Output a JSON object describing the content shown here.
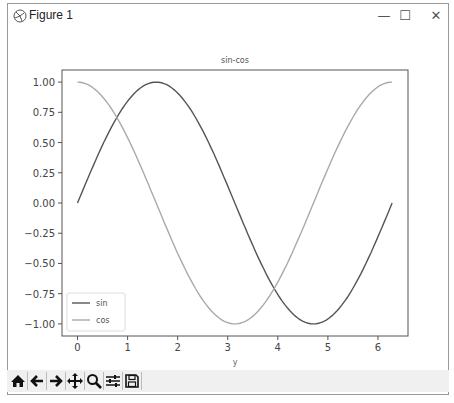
{
  "window": {
    "title": "Figure 1",
    "controls": {
      "minimize": "—",
      "maximize": "☐",
      "close": "✕"
    }
  },
  "toolbar": {
    "buttons": [
      {
        "name": "home-icon",
        "label": "Home"
      },
      {
        "name": "back-icon",
        "label": "Back"
      },
      {
        "name": "forward-icon",
        "label": "Forward"
      },
      {
        "name": "pan-icon",
        "label": "Pan"
      },
      {
        "name": "zoom-icon",
        "label": "Zoom"
      },
      {
        "name": "configure-subplots-icon",
        "label": "Configure subplots"
      },
      {
        "name": "save-icon",
        "label": "Save"
      }
    ]
  },
  "chart_data": {
    "type": "line",
    "title": "sin-cos",
    "xlabel": "y",
    "ylabel": "",
    "xlim": [
      -0.31,
      6.6
    ],
    "ylim": [
      -1.1,
      1.1
    ],
    "xticks": [
      "0",
      "1",
      "2",
      "3",
      "4",
      "5",
      "6"
    ],
    "yticks": [
      "1.00",
      "0.75",
      "0.50",
      "0.25",
      "0.00",
      "−0.25",
      "−0.50",
      "−0.75",
      "−1.00"
    ],
    "grid": false,
    "legend_position": "lower left",
    "x_range": [
      0,
      6.283
    ],
    "series": [
      {
        "name": "sin",
        "function": "sin(x)",
        "color": "#555555",
        "x": [
          0,
          0.785,
          1.571,
          2.356,
          3.142,
          3.927,
          4.712,
          5.498,
          6.283
        ],
        "values": [
          0,
          0.707,
          1.0,
          0.707,
          0,
          -0.707,
          -1.0,
          -0.707,
          0
        ]
      },
      {
        "name": "cos",
        "function": "cos(x)",
        "color": "#aaaaaa",
        "x": [
          0,
          0.785,
          1.571,
          2.356,
          3.142,
          3.927,
          4.712,
          5.498,
          6.283
        ],
        "values": [
          1.0,
          0.707,
          0,
          -0.707,
          -1.0,
          -0.707,
          0,
          0.707,
          1.0
        ]
      }
    ]
  }
}
